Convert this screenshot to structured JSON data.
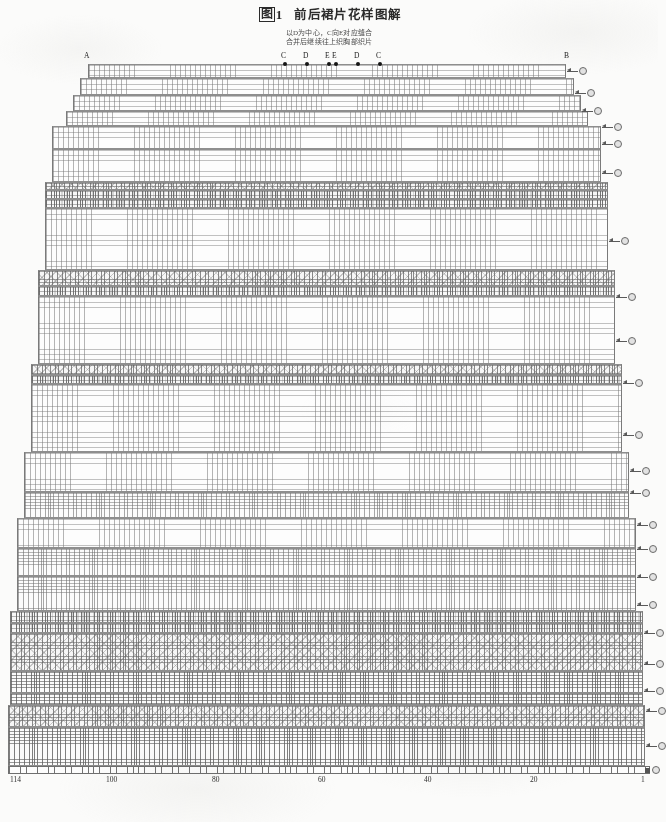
{
  "header": {
    "figure_badge": "图",
    "figure_number": "1",
    "title": "前后裙片花样图解",
    "subtitle_line1": "以D为中心，C向E对应缝合",
    "subtitle_line2": "合并后继续往上织胸部织片"
  },
  "top_markers": [
    {
      "label": "A",
      "x": 86,
      "dot": false
    },
    {
      "label": "C",
      "x": 283,
      "dot": true
    },
    {
      "label": "D",
      "x": 305,
      "dot": true
    },
    {
      "label": "E",
      "x": 327,
      "dot": true
    },
    {
      "label": "E",
      "x": 334,
      "dot": true
    },
    {
      "label": "D",
      "x": 356,
      "dot": true
    },
    {
      "label": "C",
      "x": 378,
      "dot": true
    },
    {
      "label": "B",
      "x": 566,
      "dot": false
    }
  ],
  "axis": {
    "ticks": [
      "114",
      "100",
      "80",
      "60",
      "40",
      "20",
      "1"
    ],
    "tick_x": [
      10,
      106,
      212,
      318,
      424,
      530,
      641
    ],
    "total_stitches": 114,
    "orientation": "right-to-left"
  },
  "row_markers_count": 22,
  "chart_data": {
    "type": "heatmap",
    "title": "图1 前后裙片花样图解",
    "subtitle": "以D为中心，C向E对应缝合 / 合并后继续往上织胸部织片",
    "xlabel": "",
    "ylabel": "",
    "legend_position": "none",
    "grid": true,
    "x_axis_labels": [
      "114",
      "100",
      "80",
      "60",
      "40",
      "20",
      "1"
    ],
    "x_range": [
      114,
      1
    ],
    "series": [
      {
        "name": "stitch-rows",
        "note": "each band is a block of pattern rows"
      }
    ],
    "bands": [
      {
        "id": 1,
        "top": 64,
        "height": 14,
        "left": 88,
        "right": 566,
        "texture": "plain",
        "rows": 3,
        "marker": true
      },
      {
        "id": 2,
        "top": 78,
        "height": 17,
        "left": 80,
        "right": 574,
        "texture": "plain",
        "rows": 3,
        "marker": true
      },
      {
        "id": 3,
        "top": 95,
        "height": 16,
        "left": 73,
        "right": 581,
        "texture": "plain",
        "rows": 3,
        "marker": true
      },
      {
        "id": 4,
        "top": 111,
        "height": 15,
        "left": 66,
        "right": 588,
        "texture": "plain",
        "rows": 3,
        "marker": true
      },
      {
        "id": 5,
        "top": 126,
        "height": 23,
        "left": 52,
        "right": 601,
        "texture": "plain",
        "rows": 4,
        "marker": true
      },
      {
        "id": 6,
        "top": 149,
        "height": 33,
        "left": 52,
        "right": 601,
        "texture": "plain",
        "rows": 6,
        "marker": true
      },
      {
        "id": 7,
        "top": 182,
        "height": 8,
        "left": 45,
        "right": 608,
        "texture": "lace",
        "rows": 2,
        "marker": false
      },
      {
        "id": 8,
        "top": 190,
        "height": 9,
        "left": 45,
        "right": 608,
        "texture": "purl",
        "rows": 2,
        "marker": false
      },
      {
        "id": 9,
        "top": 199,
        "height": 9,
        "left": 45,
        "right": 608,
        "texture": "purl",
        "rows": 2,
        "marker": false
      },
      {
        "id": 10,
        "top": 208,
        "height": 62,
        "left": 45,
        "right": 608,
        "texture": "plain",
        "rows": 12,
        "marker": true
      },
      {
        "id": 11,
        "top": 270,
        "height": 16,
        "left": 38,
        "right": 615,
        "texture": "lace",
        "rows": 3,
        "marker": false
      },
      {
        "id": 12,
        "top": 286,
        "height": 10,
        "left": 38,
        "right": 615,
        "texture": "purl",
        "rows": 2,
        "marker": false
      },
      {
        "id": 13,
        "top": 296,
        "height": 68,
        "left": 38,
        "right": 615,
        "texture": "plain",
        "rows": 13,
        "marker": true
      },
      {
        "id": 14,
        "top": 364,
        "height": 11,
        "left": 31,
        "right": 622,
        "texture": "lace",
        "rows": 2,
        "marker": false
      },
      {
        "id": 15,
        "top": 375,
        "height": 9,
        "left": 31,
        "right": 622,
        "texture": "purl",
        "rows": 2,
        "marker": false
      },
      {
        "id": 16,
        "top": 384,
        "height": 68,
        "left": 31,
        "right": 622,
        "texture": "plain",
        "rows": 13,
        "marker": true
      },
      {
        "id": 17,
        "top": 452,
        "height": 40,
        "left": 24,
        "right": 629,
        "texture": "plain",
        "rows": 8,
        "marker": true
      },
      {
        "id": 18,
        "top": 492,
        "height": 26,
        "left": 24,
        "right": 629,
        "texture": "fine",
        "rows": 7,
        "marker": false
      },
      {
        "id": 19,
        "top": 518,
        "height": 30,
        "left": 17,
        "right": 636,
        "texture": "plain",
        "rows": 6,
        "marker": true
      },
      {
        "id": 20,
        "top": 548,
        "height": 28,
        "left": 17,
        "right": 636,
        "texture": "fine",
        "rows": 8,
        "marker": false
      },
      {
        "id": 21,
        "top": 576,
        "height": 35,
        "left": 17,
        "right": 636,
        "texture": "fine",
        "rows": 10,
        "marker": true
      },
      {
        "id": 22,
        "top": 611,
        "height": 12,
        "left": 10,
        "right": 643,
        "texture": "purl",
        "rows": 3,
        "marker": false
      },
      {
        "id": 23,
        "top": 623,
        "height": 10,
        "left": 10,
        "right": 643,
        "texture": "purl",
        "rows": 3,
        "marker": false
      },
      {
        "id": 24,
        "top": 633,
        "height": 38,
        "left": 10,
        "right": 643,
        "texture": "lace",
        "rows": 11,
        "marker": true
      },
      {
        "id": 25,
        "top": 671,
        "height": 22,
        "left": 10,
        "right": 643,
        "texture": "rib",
        "rows": 7,
        "marker": true
      },
      {
        "id": 26,
        "top": 693,
        "height": 12,
        "left": 10,
        "right": 643,
        "texture": "rib",
        "rows": 4,
        "marker": false
      },
      {
        "id": 27,
        "top": 705,
        "height": 22,
        "left": 8,
        "right": 645,
        "texture": "lace",
        "rows": 7,
        "marker": true
      },
      {
        "id": 28,
        "top": 727,
        "height": 39,
        "left": 8,
        "right": 645,
        "texture": "rib",
        "rows": 12,
        "marker": true
      }
    ],
    "right_markers_y": [
      70,
      92,
      110,
      126,
      143,
      172,
      240,
      296,
      340,
      382,
      434,
      470,
      492,
      524,
      548,
      576,
      604,
      632,
      663,
      690,
      710,
      745
    ]
  }
}
